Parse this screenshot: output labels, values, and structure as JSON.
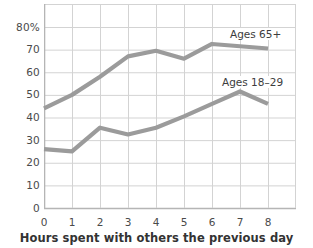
{
  "chart_data": {
    "type": "line",
    "title": "",
    "xlabel": "Hours spent with others the previous day",
    "ylabel": "",
    "x": [
      0,
      1,
      2,
      3,
      4,
      5,
      6,
      7,
      8
    ],
    "xticklabels": [
      "0",
      "1",
      "2",
      "3",
      "4",
      "5",
      "6",
      "7",
      "8"
    ],
    "yticklabels": [
      "80%",
      "70",
      "60",
      "50",
      "40",
      "30",
      "20",
      "10",
      "0"
    ],
    "ytickvalues": [
      80,
      70,
      60,
      50,
      40,
      30,
      20,
      10,
      0
    ],
    "xlim": [
      0,
      9
    ],
    "ylim": [
      0,
      80
    ],
    "grid": true,
    "legend_position": "inline-annotations",
    "series": [
      {
        "name": "Ages 65+",
        "color": "#9b9b9b",
        "values": [
          44,
          50,
          58,
          67,
          69.5,
          66,
          72.5,
          71.5,
          70.5
        ]
      },
      {
        "name": "Ages 18–29",
        "color": "#9b9b9b",
        "values": [
          26,
          25,
          35.5,
          32.5,
          35.5,
          40.5,
          46,
          51.5,
          46
        ]
      }
    ]
  },
  "axis": {
    "x_title": "Hours spent with others the previous day"
  },
  "annotations": {
    "series_65_label": "Ages 65+",
    "series_18_label": "Ages 18–29"
  },
  "colors": {
    "line": "#9b9b9b",
    "grid": "#d3d3d3",
    "axis": "#b5b5b5",
    "text": "#3a3a3a"
  }
}
